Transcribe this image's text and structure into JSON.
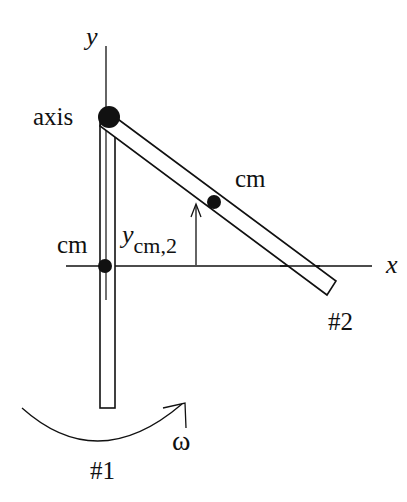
{
  "diagram": {
    "labels": {
      "y_axis": "y",
      "x_axis": "x",
      "axis": "axis",
      "cm_rod1": "cm",
      "cm_rod2": "cm",
      "ycm2_main": "y",
      "ycm2_sub": "cm,2",
      "rod1": "#1",
      "rod2": "#2",
      "omega": "ω"
    },
    "colors": {
      "stroke": "#111111",
      "background": "#ffffff"
    }
  }
}
